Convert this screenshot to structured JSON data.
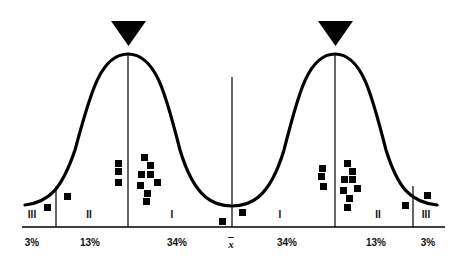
{
  "diagram": {
    "type": "double bell curve with scatter markers",
    "mean_symbol": "x̄",
    "percent_labels": [
      {
        "text": "3%",
        "x": 32
      },
      {
        "text": "13%",
        "x": 90
      },
      {
        "text": "34%",
        "x": 177
      },
      {
        "text": "34%",
        "x": 287
      },
      {
        "text": "13%",
        "x": 376
      },
      {
        "text": "3%",
        "x": 428
      }
    ],
    "zone_labels": [
      {
        "text": "III",
        "x": 32
      },
      {
        "text": "II",
        "x": 89
      },
      {
        "text": "I",
        "x": 172
      },
      {
        "text": "I",
        "x": 280
      },
      {
        "text": "II",
        "x": 378
      },
      {
        "text": "III",
        "x": 426
      }
    ],
    "peak_markers": [
      {
        "name": "left-peak-triangle",
        "x": 128
      },
      {
        "name": "right-peak-triangle",
        "x": 335
      }
    ],
    "colors": {
      "ink": "#000000",
      "background": "#ffffff"
    }
  }
}
